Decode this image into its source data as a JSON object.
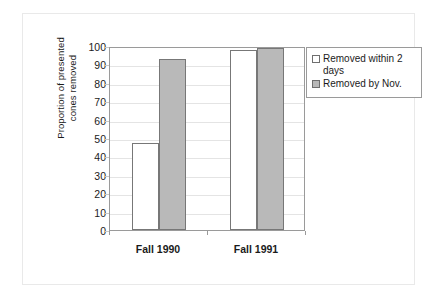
{
  "chart_data": {
    "type": "bar",
    "title": "",
    "xlabel": "",
    "ylabel": "Proportion of presented cones removed",
    "ylabel_line1": "Proportion of presented",
    "ylabel_line2": "cones removed",
    "categories": [
      "Fall 1990",
      "Fall 1991"
    ],
    "series": [
      {
        "name": "Removed within 2 days",
        "values": [
          47.5,
          98
        ],
        "swatch": "white",
        "color": "#ffffff"
      },
      {
        "name": "Removed by Nov.",
        "values": [
          93,
          99
        ],
        "swatch": "gray",
        "color": "#b9b9b9"
      }
    ],
    "ylim": [
      0,
      100
    ],
    "yticks": [
      100,
      90,
      80,
      70,
      60,
      50,
      40,
      30,
      20,
      10,
      0
    ],
    "ytick_labels": [
      "100",
      "90",
      "80",
      "70",
      "60",
      "50",
      "40",
      "30",
      "20",
      "10",
      "0"
    ],
    "grid": true,
    "grid_axis": "y",
    "legend_position": "right-top",
    "legend_entries": [
      "Removed within 2 days",
      "Removed by Nov."
    ],
    "colors": {
      "series_1_fill": "#ffffff",
      "series_2_fill": "#b9b9b9",
      "bar_outline": "#777777",
      "axis": "#9a9a9a",
      "gridline": "#e4e4e4",
      "text": "#1b1b1b",
      "background": "#ffffff"
    }
  }
}
